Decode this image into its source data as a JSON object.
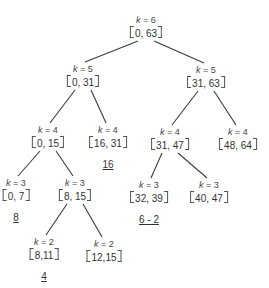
{
  "diagram": {
    "type": "binary-tree",
    "k_prefix": "k = ",
    "nodes": [
      {
        "id": "root",
        "k": "6",
        "interval": "0, 63"
      },
      {
        "id": "n-0-31",
        "k": "5",
        "interval": "0, 31"
      },
      {
        "id": "n-31-63",
        "k": "5",
        "interval": "31, 63"
      },
      {
        "id": "n-0-15",
        "k": "4",
        "interval": "0, 15"
      },
      {
        "id": "n-16-31",
        "k": "4",
        "interval": "16, 31"
      },
      {
        "id": "n-31-47",
        "k": "4",
        "interval": "31, 47"
      },
      {
        "id": "n-48-64",
        "k": "4",
        "interval": "48, 64"
      },
      {
        "id": "n-0-7",
        "k": "3",
        "interval": "0, 7"
      },
      {
        "id": "n-8-15",
        "k": "3",
        "interval": "8, 15"
      },
      {
        "id": "n-32-39",
        "k": "3",
        "interval": "32, 39"
      },
      {
        "id": "n-40-47",
        "k": "3",
        "interval": "40, 47"
      },
      {
        "id": "n-8-11",
        "k": "2",
        "interval": "8,11"
      },
      {
        "id": "n-12-15",
        "k": "2",
        "interval": "12,15"
      }
    ],
    "edges": [
      [
        "root",
        "n-0-31"
      ],
      [
        "root",
        "n-31-63"
      ],
      [
        "n-0-31",
        "n-0-15"
      ],
      [
        "n-0-31",
        "n-16-31"
      ],
      [
        "n-31-63",
        "n-31-47"
      ],
      [
        "n-31-63",
        "n-48-64"
      ],
      [
        "n-0-15",
        "n-0-7"
      ],
      [
        "n-0-15",
        "n-8-15"
      ],
      [
        "n-31-47",
        "n-32-39"
      ],
      [
        "n-31-47",
        "n-40-47"
      ],
      [
        "n-8-15",
        "n-8-11"
      ],
      [
        "n-8-15",
        "n-12-15"
      ]
    ],
    "annotations": [
      {
        "node": "n-16-31",
        "text": "16"
      },
      {
        "node": "n-0-7",
        "text": "8"
      },
      {
        "node": "n-32-39",
        "text": "6 - 2"
      },
      {
        "node": "n-8-11",
        "text": "4"
      }
    ]
  }
}
